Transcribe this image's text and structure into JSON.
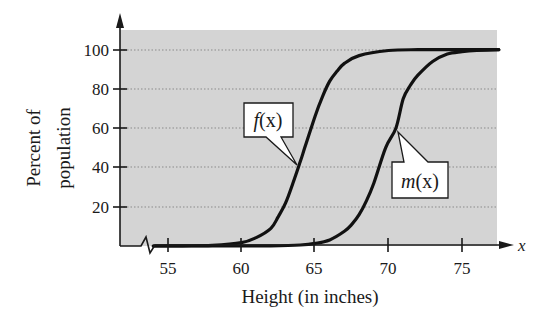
{
  "chart_data": {
    "type": "line",
    "title": "",
    "xlabel": "Height (in inches)",
    "ylabel_line1": "Percent of",
    "ylabel_line2": "population",
    "x_axis_var": "x",
    "xlim": [
      53.5,
      77.5
    ],
    "ylim": [
      0,
      108
    ],
    "x_ticks": [
      55,
      60,
      65,
      70,
      75
    ],
    "y_ticks": [
      20,
      40,
      60,
      80,
      100
    ],
    "grid": "horizontal dotted",
    "axis_break": true,
    "series": [
      {
        "name": "f(x)",
        "label": "f(x)",
        "x": [
          54,
          56,
          58,
          60,
          61,
          62,
          62.5,
          63,
          63.5,
          64,
          64.3,
          65,
          65.5,
          66,
          66.5,
          67,
          68,
          70,
          72,
          74,
          77.5
        ],
        "values": [
          0,
          0.1,
          0.3,
          1.7,
          4.3,
          9.0,
          15,
          22,
          32,
          43,
          50,
          66,
          76,
          84,
          89,
          93,
          97,
          99.6,
          100,
          100,
          100
        ]
      },
      {
        "name": "m(x)",
        "label": "m(x)",
        "x": [
          54,
          58,
          62,
          64,
          65,
          66,
          67,
          67.5,
          68,
          68.5,
          69,
          69.8,
          70.5,
          71,
          71.5,
          72,
          73,
          74,
          75,
          76,
          77.5
        ],
        "values": [
          0,
          0,
          0.1,
          0.5,
          1.3,
          3.1,
          7.5,
          11,
          16,
          23,
          32,
          50,
          60,
          75,
          82,
          87,
          94,
          97.8,
          99,
          99.6,
          100
        ]
      }
    ],
    "annotations": [
      {
        "text": "f(x)",
        "points_to": [
          63.8,
          40
        ]
      },
      {
        "text": "m(x)",
        "points_to": [
          70.5,
          58
        ]
      }
    ]
  },
  "labels": {
    "xlabel": "Height (in inches)",
    "ylabel_line1": "Percent of",
    "ylabel_line2": "population",
    "x_axis_var": "x",
    "f_label_name": "f",
    "m_label_name": "m",
    "callout_arg": "(x)",
    "tick_55": "55",
    "tick_60": "60",
    "tick_65": "65",
    "tick_70": "70",
    "tick_75": "75",
    "tick_20": "20",
    "tick_40": "40",
    "tick_60y": "60",
    "tick_80": "80",
    "tick_100": "100"
  },
  "colors": {
    "plot_bg": "#d4d4d4",
    "curve": "#111111",
    "axis": "#1a1a1a",
    "grid": "#8a8a8a"
  }
}
